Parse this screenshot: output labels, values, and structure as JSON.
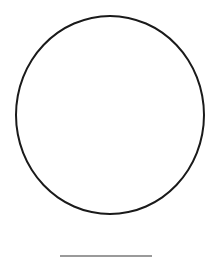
{
  "diagram": {
    "shapes": [
      {
        "type": "circle",
        "stroke_color": "#1a1a1a",
        "fill_color": "#ffffff"
      },
      {
        "type": "line",
        "stroke_color": "#9a9a9a"
      }
    ],
    "background_color": "#ffffff"
  }
}
